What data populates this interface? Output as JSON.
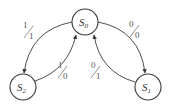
{
  "diagram": {
    "type": "state-transition-diagram",
    "stroke_color": "#3a3a3a",
    "text_color": "#333333",
    "states": [
      {
        "id": "S0",
        "base": "S",
        "sub": "0",
        "cx": 85,
        "cy": 22,
        "r": 13
      },
      {
        "id": "S1",
        "base": "S",
        "sub": "1",
        "cx": 148,
        "cy": 87,
        "r": 13
      },
      {
        "id": "S2",
        "base": "S",
        "sub": "2",
        "cx": 23,
        "cy": 87,
        "r": 13
      }
    ],
    "transitions": [
      {
        "from": "S0",
        "to": "S2",
        "input": "1",
        "output": "1"
      },
      {
        "from": "S2",
        "to": "S0",
        "input": "1",
        "output": "0"
      },
      {
        "from": "S0",
        "to": "S1",
        "input": "0",
        "output": "0"
      },
      {
        "from": "S1",
        "to": "S0",
        "input": "0",
        "output": "1"
      }
    ]
  }
}
